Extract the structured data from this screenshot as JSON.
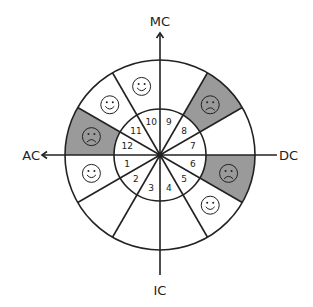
{
  "diagram": {
    "center": [
      160,
      155
    ],
    "outer_radius": 95,
    "inner_radius": 46,
    "line_color": "#222222",
    "shade_color": "#9a9a9a",
    "background": "#ffffff",
    "axes": {
      "top": {
        "label": "MC",
        "arrow": true
      },
      "bottom": {
        "label": "IC",
        "arrow": false
      },
      "left": {
        "label": "AC",
        "arrow": true
      },
      "right": {
        "label": "DC",
        "arrow": false
      }
    },
    "sectors": [
      {
        "number": "1",
        "start_deg": 180,
        "end_deg": 210,
        "shaded": false,
        "face": "smiley-icon"
      },
      {
        "number": "2",
        "start_deg": 210,
        "end_deg": 240,
        "shaded": false,
        "face": null
      },
      {
        "number": "3",
        "start_deg": 240,
        "end_deg": 270,
        "shaded": false,
        "face": null
      },
      {
        "number": "4",
        "start_deg": 270,
        "end_deg": 300,
        "shaded": false,
        "face": null
      },
      {
        "number": "5",
        "start_deg": 300,
        "end_deg": 330,
        "shaded": false,
        "face": "smiley-icon"
      },
      {
        "number": "6",
        "start_deg": 330,
        "end_deg": 360,
        "shaded": true,
        "face": "frown-icon"
      },
      {
        "number": "7",
        "start_deg": 0,
        "end_deg": 30,
        "shaded": false,
        "face": null
      },
      {
        "number": "8",
        "start_deg": 30,
        "end_deg": 60,
        "shaded": true,
        "face": "frown-icon"
      },
      {
        "number": "9",
        "start_deg": 60,
        "end_deg": 90,
        "shaded": false,
        "face": null
      },
      {
        "number": "10",
        "start_deg": 90,
        "end_deg": 120,
        "shaded": false,
        "face": "smiley-icon"
      },
      {
        "number": "11",
        "start_deg": 120,
        "end_deg": 150,
        "shaded": false,
        "face": "smiley-icon"
      },
      {
        "number": "12",
        "start_deg": 150,
        "end_deg": 180,
        "shaded": true,
        "face": "frown-icon"
      }
    ]
  }
}
